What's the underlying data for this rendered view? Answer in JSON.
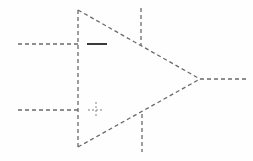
{
  "figure": {
    "style": "hand-sketch dashed line drawing",
    "canvas": {
      "width": 253,
      "height": 161
    },
    "background_color": "#fefefe",
    "line_color": "#6a6a6a",
    "line_color_faint": "#a9a9a9",
    "line_color_solid": "#3a3a3a",
    "stroke_width": 1.3,
    "dash_pattern": "4 3"
  },
  "elements": {
    "triangle_body": {
      "name": "amplifier triangle",
      "points": "78,10 200,79 78,147",
      "vertices": {
        "top_left": [
          78,
          10
        ],
        "apex_right": [
          200,
          79
        ],
        "bottom_left": [
          78,
          147
        ]
      }
    },
    "left_edge": {
      "x": 78,
      "y1": 10,
      "y2": 147
    },
    "upper_diagonal": {
      "x1": 78,
      "y1": 10,
      "x2": 200,
      "y2": 79
    },
    "lower_diagonal": {
      "x1": 78,
      "y1": 147,
      "x2": 200,
      "y2": 79
    }
  },
  "pins": {
    "inverting_input": {
      "label": "-",
      "symbol": "minus",
      "wire": {
        "x1": 18,
        "y1": 44,
        "x2": 78,
        "y2": 44
      },
      "marker": {
        "x1": 87,
        "y1": 44,
        "x2": 107,
        "y2": 44
      }
    },
    "noninverting_input": {
      "label": "+",
      "symbol": "plus",
      "wire": {
        "x1": 18,
        "y1": 110,
        "x2": 78,
        "y2": 110
      },
      "marker": {
        "cx": 96,
        "cy": 110,
        "arm": 8
      }
    },
    "output": {
      "label": "out",
      "wire": {
        "x1": 200,
        "y1": 79,
        "x2": 246,
        "y2": 79
      }
    },
    "positive_supply": {
      "label": "V+",
      "wire": {
        "x1": 141,
        "y1": 8,
        "x2": 141,
        "y2": 45
      }
    },
    "negative_supply": {
      "label": "V-",
      "wire": {
        "x1": 142,
        "y1": 114,
        "x2": 142,
        "y2": 152
      }
    }
  }
}
